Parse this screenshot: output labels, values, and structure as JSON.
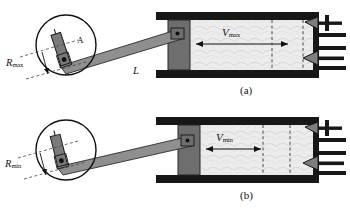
{
  "figure": {
    "type": "engineering-diagram",
    "panels": [
      {
        "id": "a",
        "caption": "(a)",
        "radius_label": "R",
        "radius_sub": "max",
        "volume_label": "V",
        "volume_sub": "max",
        "rod_label": "L",
        "crank_label": "A",
        "state": "maximum volume"
      },
      {
        "id": "b",
        "caption": "(b)",
        "radius_label": "R",
        "radius_sub": "min",
        "volume_label": "V",
        "volume_sub": "min",
        "rod_label": "",
        "crank_label": "",
        "state": "minimum volume"
      }
    ]
  },
  "colors": {
    "outline": "#111111",
    "wall": "#1a1a1a",
    "piston": "#6e6e6e",
    "rod": "#8a8a8a",
    "chamber": "#ebebeb",
    "valve": "#8a8a8a",
    "dashed": "#333333",
    "background": "#ffffff"
  },
  "geometry": {
    "panel_a": {
      "circle": {
        "cx": 66,
        "cy": 46,
        "r": 30
      },
      "crank_pin": {
        "x": 59,
        "y": 62
      },
      "rod_end": {
        "x": 180,
        "y": 36
      },
      "piston_face_x": 190,
      "cyl_left": 158,
      "cyl_right": 318,
      "cyl_top": 14,
      "cyl_bottom": 76,
      "volume_arrow": {
        "x1": 196,
        "x2": 290,
        "y": 44
      },
      "dashed_x": [
        272,
        303
      ]
    },
    "panel_b": {
      "circle": {
        "cx": 66,
        "cy": 46,
        "r": 30
      },
      "crank_pin": {
        "x": 56,
        "y": 58
      },
      "rod_end": {
        "x": 190,
        "y": 38
      },
      "piston_face_x": 200,
      "cyl_left": 158,
      "cyl_right": 318,
      "cyl_top": 14,
      "cyl_bottom": 76,
      "volume_arrow": {
        "x1": 204,
        "x2": 263,
        "y": 44
      },
      "dashed_x": [
        263,
        290
      ]
    }
  }
}
